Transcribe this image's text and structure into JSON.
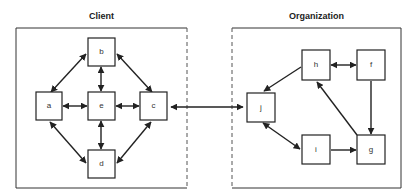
{
  "diagram": {
    "client": {
      "title": "Client",
      "nodes": [
        {
          "id": "a",
          "label": "a"
        },
        {
          "id": "b",
          "label": "b"
        },
        {
          "id": "c",
          "label": "c"
        },
        {
          "id": "d",
          "label": "d"
        },
        {
          "id": "e",
          "label": "e"
        }
      ]
    },
    "organization": {
      "title": "Organization",
      "nodes": [
        {
          "id": "f",
          "label": "f"
        },
        {
          "id": "g",
          "label": "g"
        },
        {
          "id": "h",
          "label": "h"
        },
        {
          "id": "i",
          "label": "i"
        },
        {
          "id": "j",
          "label": "j"
        }
      ]
    },
    "edges": [
      {
        "from": "a",
        "to": "b",
        "type": "bidirectional"
      },
      {
        "from": "b",
        "to": "c",
        "type": "bidirectional"
      },
      {
        "from": "b",
        "to": "e",
        "type": "bidirectional"
      },
      {
        "from": "a",
        "to": "e",
        "type": "bidirectional"
      },
      {
        "from": "e",
        "to": "c",
        "type": "bidirectional"
      },
      {
        "from": "e",
        "to": "d",
        "type": "bidirectional"
      },
      {
        "from": "a",
        "to": "d",
        "type": "bidirectional"
      },
      {
        "from": "c",
        "to": "d",
        "type": "bidirectional"
      },
      {
        "from": "c",
        "to": "j",
        "type": "bidirectional"
      },
      {
        "from": "h",
        "to": "f",
        "type": "bidirectional"
      },
      {
        "from": "h",
        "to": "j",
        "type": "directed"
      },
      {
        "from": "j",
        "to": "i",
        "type": "bidirectional"
      },
      {
        "from": "i",
        "to": "g",
        "type": "directed"
      },
      {
        "from": "f",
        "to": "g",
        "type": "directed"
      },
      {
        "from": "g",
        "to": "h",
        "type": "directed"
      }
    ]
  }
}
